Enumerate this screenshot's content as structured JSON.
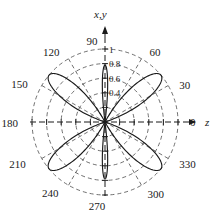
{
  "figure": {
    "top_cropped_text": "",
    "axis_labels": {
      "vertical": "x,y",
      "horizontal": "z"
    },
    "colors": {
      "curve": "#1a1a1a",
      "grid": "#4d4d4d",
      "axis": "#1a1a1a",
      "background": "#ffffff"
    }
  },
  "chart_data": {
    "type": "line",
    "plot_kind": "polar-radiation-pattern",
    "title": "",
    "xlabel": "z",
    "ylabel": "x,y",
    "angle_unit": "degrees",
    "angle_ticks": [
      0,
      30,
      60,
      90,
      120,
      150,
      180,
      210,
      240,
      270,
      300,
      330
    ],
    "angle_tick_labels": [
      "0",
      "30",
      "60",
      "90",
      "120",
      "150",
      "180",
      "210",
      "240",
      "270",
      "300",
      "330"
    ],
    "radial_ticks": [
      0.2,
      0.4,
      0.6,
      0.8,
      1.0
    ],
    "radial_tick_labels": [
      "0.2",
      "0.4",
      "0.6",
      "0.8",
      "1"
    ],
    "radial_labeled": [
      "0.4",
      "0.6",
      "0.8",
      "1"
    ],
    "rlim": [
      0,
      1
    ],
    "grid": true,
    "grid_style": "dashed",
    "legend": null,
    "lobes": [
      {
        "center_deg": 90,
        "peak_r": 0.78,
        "half_width_deg": 7,
        "shape": "narrow"
      },
      {
        "center_deg": 270,
        "peak_r": 0.78,
        "half_width_deg": 7,
        "shape": "narrow"
      },
      {
        "center_deg": 40,
        "peak_r": 1.0,
        "half_width_deg": 22,
        "shape": "broad"
      },
      {
        "center_deg": 140,
        "peak_r": 1.0,
        "half_width_deg": 22,
        "shape": "broad"
      },
      {
        "center_deg": 220,
        "peak_r": 1.0,
        "half_width_deg": 22,
        "shape": "broad"
      },
      {
        "center_deg": 320,
        "peak_r": 1.0,
        "half_width_deg": 22,
        "shape": "broad"
      }
    ],
    "series": [
      {
        "name": "radiation pattern",
        "description": "Six-lobe polar pattern: two narrow lobes along x,y (90/270) and four broad tilted lobes near 40/140/220/320"
      }
    ]
  }
}
